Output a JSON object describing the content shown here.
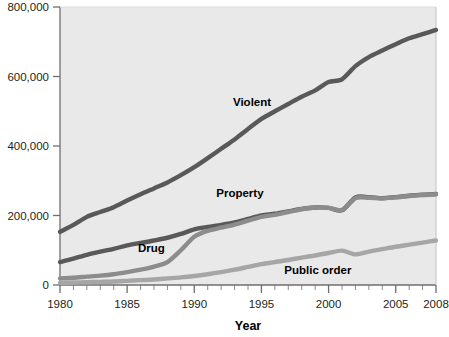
{
  "chart_data": {
    "type": "line",
    "title": "",
    "xlabel": "Year",
    "ylabel": "",
    "xlim": [
      1980,
      2008
    ],
    "ylim": [
      0,
      800000
    ],
    "grid": false,
    "legend_position": "inline-labels",
    "x_tick_labels": [
      "1980",
      "1985",
      "1990",
      "1995",
      "2000",
      "2005",
      "2008"
    ],
    "x_tick_values": [
      1980,
      1985,
      1990,
      1995,
      2000,
      2005,
      2008
    ],
    "x_minor_ticks": [
      1981,
      1982,
      1983,
      1984,
      1986,
      1987,
      1988,
      1989,
      1991,
      1992,
      1993,
      1994,
      1996,
      1997,
      1998,
      1999,
      2001,
      2002,
      2003,
      2004,
      2006,
      2007
    ],
    "y_tick_labels": [
      "0",
      "200,000",
      "400,000",
      "600,000",
      "800,000"
    ],
    "y_tick_values": [
      0,
      200000,
      400000,
      600000,
      800000
    ],
    "x": [
      1980,
      1981,
      1982,
      1983,
      1984,
      1985,
      1986,
      1987,
      1988,
      1989,
      1990,
      1991,
      1992,
      1993,
      1994,
      1995,
      1996,
      1997,
      1998,
      1999,
      2000,
      2001,
      2002,
      2003,
      2004,
      2005,
      2006,
      2007,
      2008
    ],
    "series": [
      {
        "name": "Violent",
        "color": "#595959",
        "label_x": 1994.3,
        "label_y": 515000,
        "values": [
          153000,
          173000,
          196000,
          210000,
          224000,
          243000,
          261000,
          278000,
          295000,
          316000,
          339000,
          365000,
          392000,
          419000,
          449000,
          478000,
          500000,
          521000,
          542000,
          560000,
          584000,
          592000,
          630000,
          656000,
          675000,
          693000,
          710000,
          722000,
          734000
        ]
      },
      {
        "name": "Property",
        "color": "#595959",
        "label_x": 1993.4,
        "label_y": 253000,
        "values": [
          66000,
          76000,
          87000,
          96000,
          104000,
          114000,
          121000,
          128000,
          136000,
          147000,
          160000,
          167000,
          173000,
          180000,
          190000,
          200000,
          205000,
          212000,
          219000,
          223000,
          222000,
          215000,
          252000,
          253000,
          250000,
          253000,
          257000,
          260000,
          262000
        ]
      },
      {
        "name": "Drug",
        "color": "#8c8c8c",
        "label_x": 1986.8,
        "label_y": 94000,
        "values": [
          19000,
          21000,
          24000,
          27000,
          31000,
          37000,
          44000,
          53000,
          66000,
          100000,
          139000,
          156000,
          165000,
          174000,
          185000,
          196000,
          202000,
          210000,
          218000,
          223000,
          222000,
          216000,
          250000,
          251000,
          249000,
          252000,
          256000,
          259000,
          261000
        ]
      },
      {
        "name": "Public order",
        "color": "#a6a6a6",
        "label_x": 1999.2,
        "label_y": 32000,
        "values": [
          6000,
          7000,
          8000,
          9000,
          10000,
          12000,
          14000,
          16000,
          19000,
          22000,
          26000,
          31000,
          37000,
          44000,
          52000,
          60000,
          66000,
          72000,
          79000,
          85000,
          92000,
          99000,
          88000,
          96000,
          103000,
          110000,
          116000,
          122000,
          128000
        ]
      }
    ]
  },
  "axes": {
    "year_title": "Year"
  }
}
